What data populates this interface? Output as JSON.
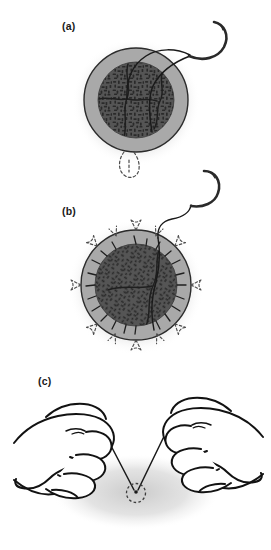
{
  "figure": {
    "width": 271,
    "height": 550,
    "background_color": "#ffffff",
    "panel_count": 3
  },
  "palette": {
    "background": "#ffffff",
    "outer_ring_fill": "#a9a9a9",
    "outer_ring_stroke": "#2b2b2b",
    "core_fill": "#4e4e4e",
    "core_speckle": "#2a2a2a",
    "line_color": "#1a1a1a",
    "shadow_color": "#c9c9c9",
    "dashed_color": "#555555",
    "hand_outline": "#121212"
  },
  "panels": [
    {
      "id": "panel-a",
      "label": "(a)",
      "label_x": 62,
      "label_y": 30,
      "description": "Circular tissue mass with outer ring and speckled core; curved needle with suture thread enters at upper right; dashed loop marks exit point below.",
      "circle": {
        "cx": 136,
        "cy": 100,
        "r_outer": 52,
        "r_core": 38
      },
      "shadow": {
        "cx": 136,
        "cy": 102,
        "rx": 62,
        "ry": 62
      },
      "needle": {
        "present": true,
        "position": "upper-right",
        "shape": "curved-hook"
      },
      "dashed_marker": {
        "present": true,
        "position": "bottom",
        "shape": "small-loop"
      }
    },
    {
      "id": "panel-b",
      "label": "(b)",
      "label_x": 62,
      "label_y": 215,
      "description": "Same circular tissue mass with radiating dashed arrows around the perimeter indicating tension, spikes projecting from the core, suture thread exiting at top.",
      "circle": {
        "cx": 136,
        "cy": 285,
        "r_outer": 55,
        "r_core": 41
      },
      "shadow": {
        "cx": 136,
        "cy": 287,
        "rx": 66,
        "ry": 66
      },
      "needle": {
        "present": true,
        "position": "top-right",
        "shape": "curved-hook"
      },
      "radiating_arrows": {
        "present": true,
        "count": 12
      }
    },
    {
      "id": "panel-c",
      "label": "(c)",
      "label_x": 38,
      "label_y": 385,
      "description": "Two hands grasping suture ends and pulling them apart; the threads converge on a small dashed circle representing the cinched purse-string knot.",
      "shadow": {
        "cx": 136,
        "cy": 492,
        "rx": 82,
        "ry": 36
      },
      "knot": {
        "cx": 136,
        "cy": 494,
        "r": 9,
        "style": "dashed-circle"
      },
      "hands": [
        {
          "side": "left",
          "pose": "closed-fist-pinching-suture"
        },
        {
          "side": "right",
          "pose": "closed-fist-pinching-suture"
        }
      ]
    }
  ]
}
